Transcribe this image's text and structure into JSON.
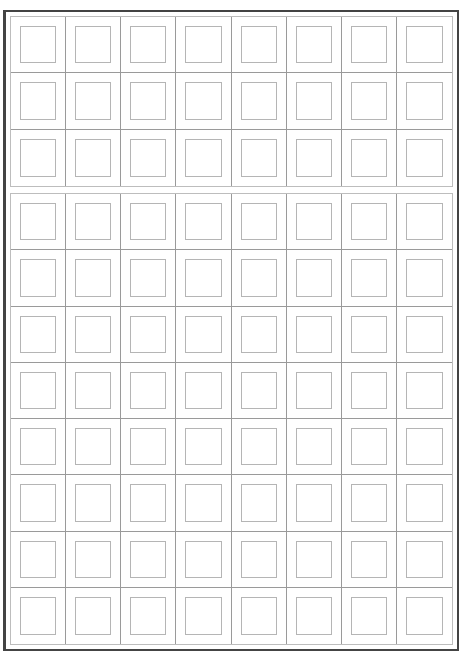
{
  "sheet": {
    "columns": 8,
    "blocks": [
      {
        "name": "top-block",
        "rows": 3,
        "top": 16,
        "height": 171
      },
      {
        "name": "bottom-block",
        "rows": 8,
        "top": 193,
        "height": 452
      }
    ],
    "colors": {
      "frame": "#444444",
      "grid_line": "#9a9a9a",
      "box_line": "#b5b5b5",
      "background": "#ffffff"
    }
  }
}
